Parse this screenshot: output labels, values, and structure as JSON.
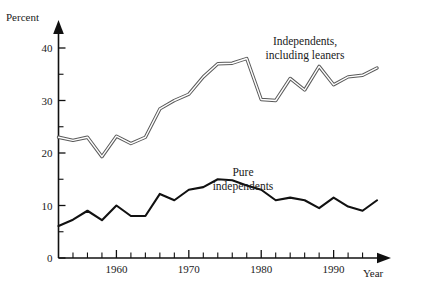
{
  "chart_data": {
    "type": "line",
    "title": "",
    "xlabel": "Year",
    "ylabel": "Percent",
    "xlim": [
      1952,
      1996
    ],
    "ylim": [
      0,
      42
    ],
    "grid": false,
    "legend_position": "inline-annotations",
    "y_ticks_major": [
      0,
      10,
      20,
      30,
      40
    ],
    "y_ticks_minor": [
      5,
      15,
      25,
      35
    ],
    "x_ticks_major": [
      1960,
      1970,
      1980,
      1990
    ],
    "x_ticks_minor": [
      1954,
      1956,
      1958,
      1962,
      1964,
      1966,
      1968,
      1972,
      1974,
      1976,
      1978,
      1982,
      1984,
      1986,
      1988,
      1992,
      1994
    ],
    "x_tick_labels": [
      "1960",
      "1970",
      "1980",
      "1990"
    ],
    "y_tick_labels": [
      "0",
      "10",
      "20",
      "30",
      "40"
    ],
    "x": [
      1952,
      1954,
      1956,
      1958,
      1960,
      1962,
      1964,
      1966,
      1968,
      1970,
      1972,
      1974,
      1976,
      1978,
      1980,
      1982,
      1984,
      1986,
      1988,
      1990,
      1992,
      1994,
      1996
    ],
    "series": [
      {
        "name": "Independents, including leaners",
        "style": "hollow-double-line",
        "values": [
          23.0,
          22.4,
          23.0,
          19.3,
          23.2,
          21.8,
          23.0,
          28.4,
          30.0,
          31.2,
          34.5,
          37.0,
          37.1,
          38.0,
          30.2,
          30.0,
          34.2,
          32.0,
          36.5,
          33.0,
          34.5,
          34.8,
          36.2
        ]
      },
      {
        "name": "Pure independents",
        "style": "solid-line",
        "values": [
          6.1,
          7.3,
          9.0,
          7.2,
          10.0,
          8.0,
          8.0,
          12.2,
          11.0,
          13.0,
          13.5,
          15.0,
          14.8,
          13.8,
          13.0,
          11.0,
          11.5,
          11.0,
          9.5,
          11.5,
          9.8,
          9.0,
          11.0
        ]
      }
    ],
    "annotations": [
      {
        "text_line1": "Independents,",
        "text_line2": "including leaners",
        "x": 1993,
        "y": 44
      },
      {
        "text_line1": "Pure",
        "text_line2": "independents",
        "x": 1979,
        "y": 20
      }
    ]
  }
}
